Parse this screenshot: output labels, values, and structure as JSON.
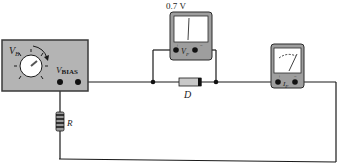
{
  "diagram": {
    "type": "circuit",
    "supply": {
      "label_main": "V",
      "label_sub": "B",
      "terminal_label_main": "V",
      "terminal_label_sub": "BIAS"
    },
    "voltmeter": {
      "reading": "0.7 V",
      "label_main": "V",
      "label_sub": "F",
      "plus": "+",
      "minus": "−"
    },
    "ammeter": {
      "label_main": "I",
      "label_sub": "F",
      "plus": "+",
      "minus": "−"
    },
    "diode": {
      "label": "D"
    },
    "resistor": {
      "label": "R"
    },
    "colors": {
      "panel": "#b4b4b4",
      "panel_border": "#3a3a3a",
      "wire": "#1a1a1a",
      "meter_face": "#ffffff",
      "diode_body": "#c8c8c8"
    }
  }
}
